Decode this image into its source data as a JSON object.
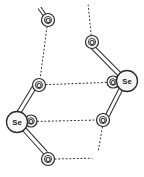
{
  "figure": {
    "background_color": "#ffffff",
    "stroke_color": "#333333",
    "atom_fill_color": "#f7f7f7",
    "label_color": "#1a1a1a"
  },
  "atoms": [
    {
      "id": "o_top_left",
      "label": "O",
      "element": "O",
      "x": 48,
      "y": 20,
      "r": 6.5
    },
    {
      "id": "o_mid_left",
      "label": "O",
      "element": "O",
      "x": 39,
      "y": 85,
      "r": 6.5
    },
    {
      "id": "se_left",
      "label": "Se",
      "element": "Se",
      "x": 17,
      "y": 122,
      "r": 10.5
    },
    {
      "id": "o_left_bridge",
      "label": "O",
      "element": "O",
      "x": 31,
      "y": 121,
      "r": 6.0
    },
    {
      "id": "o_bottom_left",
      "label": "O",
      "element": "O",
      "x": 48,
      "y": 159,
      "r": 6.5
    },
    {
      "id": "o_top_right",
      "label": "O",
      "element": "O",
      "x": 92,
      "y": 42,
      "r": 6.5
    },
    {
      "id": "se_right",
      "label": "Se",
      "element": "Se",
      "x": 127,
      "y": 81,
      "r": 10.5
    },
    {
      "id": "o_right_bridge",
      "label": "O",
      "element": "O",
      "x": 113,
      "y": 82,
      "r": 6.0
    },
    {
      "id": "o_mid_right",
      "label": "O",
      "element": "O",
      "x": 103,
      "y": 120,
      "r": 6.5
    }
  ],
  "bonds": [
    {
      "id": "bond_se_left_o_mid_left",
      "from": "se_left",
      "to": "o_mid_left",
      "type": "double"
    },
    {
      "id": "bond_se_left_o_left_bridge",
      "from": "se_left",
      "to": "o_left_bridge",
      "type": "double"
    },
    {
      "id": "bond_se_left_o_bottom_left",
      "from": "se_left",
      "to": "o_bottom_left",
      "type": "double"
    },
    {
      "id": "bond_se_right_o_top_right",
      "from": "se_right",
      "to": "o_top_right",
      "type": "double"
    },
    {
      "id": "bond_se_right_o_right_bridge",
      "from": "se_right",
      "to": "o_right_bridge",
      "type": "double"
    },
    {
      "id": "bond_se_right_o_mid_right",
      "from": "se_right",
      "to": "o_mid_right",
      "type": "double"
    }
  ],
  "hydrogen_bonds": [
    {
      "id": "hb_o_top_left_o_mid_left",
      "from": "o_top_left",
      "to": "o_mid_left",
      "style": "dotted"
    },
    {
      "id": "hb_o_mid_left_o_right_bridge",
      "from": "o_mid_left",
      "to": "o_right_bridge",
      "style": "dotted"
    },
    {
      "id": "hb_o_left_bridge_o_mid_right",
      "from": "o_left_bridge",
      "to": "o_mid_right",
      "style": "dotted"
    }
  ],
  "open_contacts": [
    {
      "id": "contact_top_right_up",
      "from": "o_top_right",
      "x2": 88,
      "y2": 5,
      "style": "dotted"
    },
    {
      "id": "contact_mid_right_down",
      "from": "o_mid_right",
      "x2": 98,
      "y2": 150,
      "style": "dotted"
    },
    {
      "id": "contact_bottom_left_right",
      "from": "o_bottom_left",
      "x2": 90,
      "y2": 158,
      "style": "dotted"
    }
  ],
  "terminal_stubs": [
    {
      "id": "stub_o_top_left",
      "from": "o_top_left",
      "x2": 38,
      "y2": 8,
      "type": "double"
    }
  ]
}
